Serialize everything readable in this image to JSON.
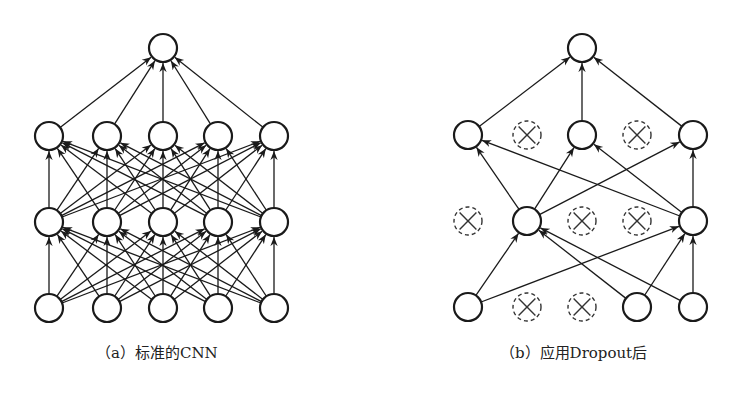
{
  "figure": {
    "panels": [
      {
        "id": "a",
        "caption": "（a）标准的CNN",
        "description": "standard fully connected network",
        "columns_x": [
          49,
          107,
          163,
          218,
          274
        ],
        "rows_y": {
          "output": 48,
          "hidden2": 136,
          "hidden1": 222,
          "input": 308
        },
        "output_x": 163,
        "dropped": {
          "hidden2": [],
          "hidden1": [],
          "input": []
        },
        "full_connections": true
      },
      {
        "id": "b",
        "caption": "（b）应用Dropout后",
        "description": "network after applying dropout",
        "columns_x": [
          468,
          527,
          582,
          637,
          693
        ],
        "rows_y": {
          "output": 48,
          "hidden2": 135,
          "hidden1": 221,
          "input": 307
        },
        "output_x": 582,
        "dropped": {
          "hidden2": [
            1,
            3
          ],
          "hidden1": [
            0,
            2,
            3
          ],
          "input": [
            1,
            2
          ]
        },
        "edges": [
          [
            "input",
            0,
            "hidden1",
            1
          ],
          [
            "input",
            0,
            "hidden1",
            4
          ],
          [
            "input",
            3,
            "hidden1",
            1
          ],
          [
            "input",
            3,
            "hidden1",
            4
          ],
          [
            "input",
            4,
            "hidden1",
            1
          ],
          [
            "input",
            4,
            "hidden1",
            4
          ],
          [
            "hidden1",
            1,
            "hidden2",
            0
          ],
          [
            "hidden1",
            1,
            "hidden2",
            2
          ],
          [
            "hidden1",
            1,
            "hidden2",
            4
          ],
          [
            "hidden1",
            4,
            "hidden2",
            0
          ],
          [
            "hidden1",
            4,
            "hidden2",
            2
          ],
          [
            "hidden1",
            4,
            "hidden2",
            4
          ],
          [
            "hidden2",
            0,
            "output",
            0
          ],
          [
            "hidden2",
            2,
            "output",
            0
          ],
          [
            "hidden2",
            4,
            "output",
            0
          ]
        ]
      }
    ],
    "style": {
      "node_radius": 14,
      "stroke": "#1a1a1a",
      "dropped_stroke": "#333333",
      "background": "#ffffff"
    }
  }
}
